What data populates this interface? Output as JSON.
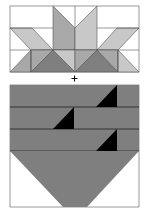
{
  "diagram": {
    "type": "quilt-block-assembly",
    "operator": "+",
    "colors": {
      "background": "#ffffff",
      "light_gray": "#c8c8c8",
      "mid_gray": "#a8a8a8",
      "dark_gray": "#7f7f7f",
      "black": "#000000",
      "outline": "#555555"
    },
    "top_block": {
      "label": "star-point block",
      "bounds": {
        "x": 10,
        "y": 6,
        "w": 129,
        "h": 66
      }
    },
    "bottom_block": {
      "label": "striped basket block",
      "bounds": {
        "x": 10,
        "y": 85,
        "w": 129,
        "h": 122
      },
      "stripes": 3,
      "black_triangles": 3
    }
  }
}
